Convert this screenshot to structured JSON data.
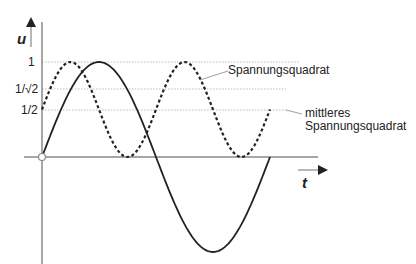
{
  "diagram": {
    "axes": {
      "y_label": "u",
      "x_label": "t"
    },
    "y_ticks": [
      {
        "label": "1",
        "value": 1
      },
      {
        "label": "1/√2",
        "value": 0.7071
      },
      {
        "label": "1/2",
        "value": 0.5
      }
    ],
    "curves": [
      {
        "name": "Spannung",
        "style": "solid",
        "function": "sin(t)",
        "periods": 1
      },
      {
        "name": "Spannungsquadrat",
        "style": "dashed",
        "function": "sin²(t)",
        "periods": 1
      }
    ],
    "annotations": {
      "square": "Spannungsquadrat",
      "mean_line1": "mittleres",
      "mean_line2": "Spannungsquadrat"
    },
    "colors": {
      "curve": "#222222",
      "axis": "#888888",
      "grid": "#aaaaaa"
    }
  }
}
